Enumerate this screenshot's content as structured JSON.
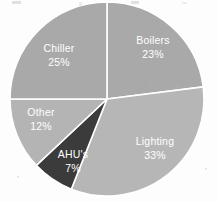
{
  "chart_data": {
    "type": "pie",
    "title": "",
    "subtitle": "",
    "xlabel": "",
    "ylabel": "",
    "legend_position": "none",
    "labels_inside_slices": true,
    "start_angle_deg": 0,
    "direction": "clockwise",
    "unit": "%",
    "categories": [
      "Boilers",
      "Lighting",
      "AHU's",
      "Other",
      "Chiller"
    ],
    "values": [
      23,
      33,
      7,
      12,
      25
    ],
    "slices": [
      {
        "name": "Boilers",
        "value": 23,
        "value_label": "23%",
        "color": "#a9a9a9",
        "label_color": "#ffffff",
        "start_deg": 0,
        "end_deg": 82.8
      },
      {
        "name": "Lighting",
        "value": 33,
        "value_label": "33%",
        "color": "#b6b6b6",
        "label_color": "#ffffff",
        "start_deg": 82.8,
        "end_deg": 201.6
      },
      {
        "name": "AHU's",
        "value": 7,
        "value_label": "7%",
        "color": "#3b3b3b",
        "label_color": "#ffffff",
        "start_deg": 201.6,
        "end_deg": 226.8
      },
      {
        "name": "Other",
        "value": 12,
        "value_label": "12%",
        "color": "#b4b4b4",
        "label_color": "#ffffff",
        "start_deg": 226.8,
        "end_deg": 270.0
      },
      {
        "name": "Chiller",
        "value": 25,
        "value_label": "25%",
        "color": "#a9a9a9",
        "label_color": "#ffffff",
        "start_deg": 270.0,
        "end_deg": 360.0
      }
    ],
    "total": 100,
    "separator_color": "#ffffff",
    "background_color": "#fdfdfd"
  },
  "geometry": {
    "center_x": 107,
    "center_y": 99,
    "radius": 97
  },
  "labels": {
    "boilers": {
      "name": "Boilers",
      "pct": "23%",
      "x": 153,
      "y": 47
    },
    "lighting": {
      "name": "Lighting",
      "pct": "33%",
      "x": 155,
      "y": 148
    },
    "ahus": {
      "name": "AHU's",
      "pct": "7%",
      "x": 73,
      "y": 160
    },
    "other": {
      "name": "Other",
      "pct": "12%",
      "x": 41,
      "y": 119
    },
    "chiller": {
      "name": "Chiller",
      "pct": "25%",
      "x": 59,
      "y": 55
    }
  }
}
